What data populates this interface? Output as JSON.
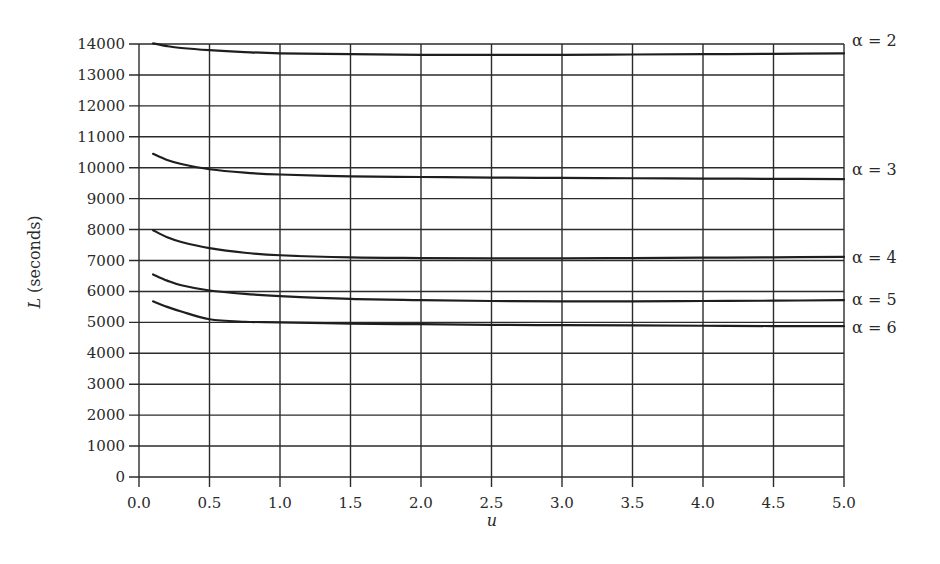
{
  "chart_data": {
    "type": "line",
    "title": "",
    "xlabel": "u",
    "ylabel": "L (seconds)",
    "xlim": [
      0.0,
      5.0
    ],
    "ylim": [
      0,
      14000
    ],
    "grid": true,
    "legend_position": "inline-right",
    "x_ticks": [
      "0.0",
      "0.5",
      "1.0",
      "1.5",
      "2.0",
      "2.5",
      "3.0",
      "3.5",
      "4.0",
      "4.5",
      "5.0"
    ],
    "y_ticks": [
      "0",
      "1000",
      "2000",
      "3000",
      "4000",
      "5000",
      "6000",
      "7000",
      "8000",
      "9000",
      "10000",
      "11000",
      "12000",
      "13000",
      "14000"
    ],
    "x": [
      0.1,
      0.2,
      0.3,
      0.5,
      0.75,
      1.0,
      1.5,
      2.0,
      2.5,
      3.0,
      3.5,
      4.0,
      4.5,
      5.0
    ],
    "series": [
      {
        "name": "α = 2",
        "values": [
          14020,
          13930,
          13870,
          13800,
          13740,
          13700,
          13670,
          13650,
          13650,
          13650,
          13660,
          13670,
          13680,
          13700
        ]
      },
      {
        "name": "α = 3",
        "values": [
          10450,
          10250,
          10120,
          9950,
          9840,
          9780,
          9720,
          9700,
          9680,
          9670,
          9660,
          9650,
          9640,
          9630
        ]
      },
      {
        "name": "α = 4",
        "values": [
          7980,
          7750,
          7600,
          7400,
          7250,
          7170,
          7100,
          7080,
          7070,
          7070,
          7080,
          7090,
          7100,
          7120
        ]
      },
      {
        "name": "α = 5",
        "values": [
          6550,
          6350,
          6200,
          6030,
          5920,
          5850,
          5760,
          5720,
          5690,
          5680,
          5680,
          5690,
          5700,
          5720
        ]
      },
      {
        "name": "α = 6",
        "values": [
          5680,
          5500,
          5350,
          5100,
          5020,
          5000,
          4960,
          4940,
          4920,
          4910,
          4900,
          4890,
          4880,
          4880
        ]
      }
    ]
  }
}
